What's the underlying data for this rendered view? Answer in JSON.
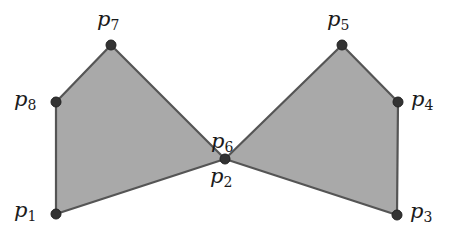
{
  "diagram": {
    "title": "",
    "fill_color": "#a9a9a9",
    "stroke_color": "#555555",
    "point_color": "#333333",
    "points": [
      {
        "name": "p",
        "sub": "1",
        "x": 56,
        "y": 214,
        "lx": 14,
        "ly": 202
      },
      {
        "name": "p",
        "sub": "2",
        "x": 225,
        "y": 159,
        "lx": 211,
        "ly": 168
      },
      {
        "name": "p",
        "sub": "3",
        "x": 397,
        "y": 215,
        "lx": 411,
        "ly": 203
      },
      {
        "name": "p",
        "sub": "4",
        "x": 398,
        "y": 102,
        "lx": 411,
        "ly": 91
      },
      {
        "name": "p",
        "sub": "5",
        "x": 342,
        "y": 45,
        "lx": 327,
        "ly": 11
      },
      {
        "name": "p",
        "sub": "6",
        "x": 225,
        "y": 159,
        "lx": 212,
        "ly": 134
      },
      {
        "name": "p",
        "sub": "7",
        "x": 111,
        "y": 45,
        "lx": 97,
        "ly": 11
      },
      {
        "name": "p",
        "sub": "8",
        "x": 56,
        "y": 102,
        "lx": 14,
        "ly": 91
      }
    ],
    "polygons": [
      {
        "name": "left-quad",
        "vertices": [
          "p1",
          "p2",
          "p7",
          "p8"
        ]
      },
      {
        "name": "right-quad",
        "vertices": [
          "p6",
          "p3",
          "p4",
          "p5"
        ]
      }
    ]
  }
}
